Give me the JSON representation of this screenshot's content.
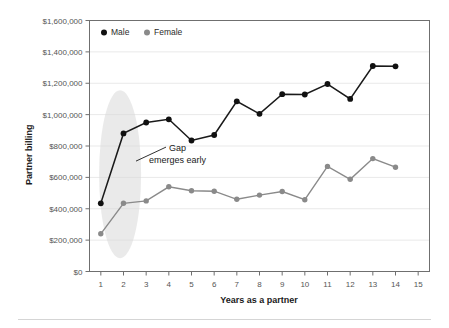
{
  "chart_data": {
    "type": "line",
    "title": "",
    "xlabel": "Years as a partner",
    "ylabel": "Partner billing",
    "x": [
      1,
      2,
      3,
      4,
      5,
      6,
      7,
      8,
      9,
      10,
      11,
      12,
      13,
      14
    ],
    "xlim": [
      0.5,
      15.5
    ],
    "ylim": [
      0,
      1600000
    ],
    "xticks": [
      "1",
      "2",
      "3",
      "4",
      "5",
      "6",
      "7",
      "8",
      "9",
      "10",
      "11",
      "12",
      "13",
      "14",
      "15"
    ],
    "yticks": [
      "$0",
      "$200,000",
      "$400,000",
      "$600,000",
      "$800,000",
      "$1,000,000",
      "$1,200,000",
      "$1,400,000",
      "$1,600,000"
    ],
    "ytick_values": [
      0,
      200000,
      400000,
      600000,
      800000,
      1000000,
      1200000,
      1400000,
      1600000
    ],
    "grid": true,
    "legend_position": "top-left",
    "series": [
      {
        "name": "Male",
        "color": "#111111",
        "values": [
          435000,
          880000,
          950000,
          970000,
          835000,
          870000,
          1085000,
          1005000,
          1130000,
          1128000,
          1195000,
          1100000,
          1310000,
          1308000
        ]
      },
      {
        "name": "Female",
        "color": "#8a8a8a",
        "values": [
          240000,
          435000,
          450000,
          540000,
          515000,
          512000,
          460000,
          487000,
          510000,
          458000,
          670000,
          588000,
          720000,
          665000
        ]
      }
    ],
    "annotations": [
      {
        "text_line1": "Gap",
        "text_line2": "emerges early",
        "target_x": 2.2,
        "target_y": 780000
      }
    ],
    "highlight_region": {
      "label": "early-years-highlight",
      "x_center": 1.85,
      "y_center": 620000,
      "color": "#d8d8d8"
    }
  },
  "legend": {
    "items": [
      {
        "label": "Male",
        "color": "#111111"
      },
      {
        "label": "Female",
        "color": "#8a8a8a"
      }
    ]
  }
}
